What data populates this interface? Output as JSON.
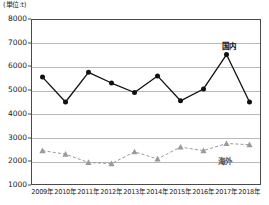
{
  "chart_data": {
    "type": "line",
    "title": "",
    "unit_label": "(単位:t)",
    "xlabel": "",
    "ylabel": "",
    "categories": [
      "2009年",
      "2010年",
      "2011年",
      "2012年",
      "2013年",
      "2014年",
      "2015年",
      "2016年",
      "2017年",
      "2018年"
    ],
    "ylim": [
      1000,
      8000
    ],
    "ytick_labels": [
      "8000",
      "7000",
      "6000",
      "5000",
      "4000",
      "3000",
      "2000",
      "1000"
    ],
    "ytick_values": [
      8000,
      7000,
      6000,
      5000,
      4000,
      3000,
      2000,
      1000
    ],
    "grid": true,
    "grid_axis": "y",
    "legend_position": "inline-annotation",
    "series": [
      {
        "name": "国内",
        "marker": "circle",
        "line_style": "solid",
        "color": "#111111",
        "values": [
          5550,
          4500,
          5750,
          5300,
          4900,
          5600,
          4550,
          5050,
          6500,
          4500
        ]
      },
      {
        "name": "海外",
        "marker": "triangle",
        "line_style": "dashed",
        "color": "#9a9a9a",
        "values": [
          2450,
          2300,
          1950,
          1900,
          2400,
          2100,
          2600,
          2450,
          2750,
          2700
        ]
      }
    ]
  }
}
